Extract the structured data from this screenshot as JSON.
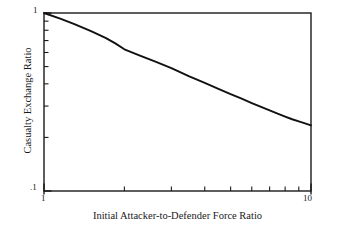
{
  "chart_data": {
    "type": "line",
    "title": "",
    "xlabel": "Initial Attacker-to-Defender Force Ratio",
    "ylabel": "Casualty Exchange Ratio",
    "xscale": "log",
    "yscale": "log",
    "xlim": [
      1,
      10
    ],
    "ylim": [
      0.1,
      1
    ],
    "grid": false,
    "legend": null,
    "x_tick_labels": [
      "1",
      "10"
    ],
    "x_tick_values": [
      1,
      10
    ],
    "x_minor_ticks": [
      2,
      3,
      4,
      5,
      6,
      7,
      8,
      9
    ],
    "y_tick_labels": [
      "1",
      ".1"
    ],
    "y_tick_values": [
      1,
      0.1
    ],
    "y_minor_ticks": [
      0.9,
      0.8,
      0.7,
      0.6,
      0.5,
      0.4,
      0.3,
      0.2
    ],
    "series": [
      {
        "name": "Casualty Exchange Ratio",
        "color": "#111111",
        "x": [
          1.0,
          1.15,
          1.3,
          1.5,
          1.7,
          1.85,
          2.0,
          2.3,
          2.6,
          3.0,
          3.5,
          4.0,
          4.5,
          5.0,
          5.5,
          6.0,
          6.5,
          7.0,
          7.5,
          8.0,
          8.5,
          9.0,
          9.5,
          10.0
        ],
        "y": [
          1.0,
          0.93,
          0.865,
          0.79,
          0.725,
          0.675,
          0.625,
          0.575,
          0.535,
          0.49,
          0.44,
          0.405,
          0.375,
          0.35,
          0.33,
          0.312,
          0.297,
          0.284,
          0.272,
          0.262,
          0.253,
          0.246,
          0.24,
          0.234
        ]
      }
    ]
  },
  "axes": {
    "x_title": "Initial Attacker-to-Defender Force Ratio",
    "y_title": "Casualty Exchange Ratio",
    "x_label_min": "1",
    "x_label_max": "10",
    "y_label_min": ".1",
    "y_label_max": "1"
  },
  "style": {
    "line_color": "#111111",
    "axis_color": "#1a1a1a",
    "background": "#ffffff"
  }
}
